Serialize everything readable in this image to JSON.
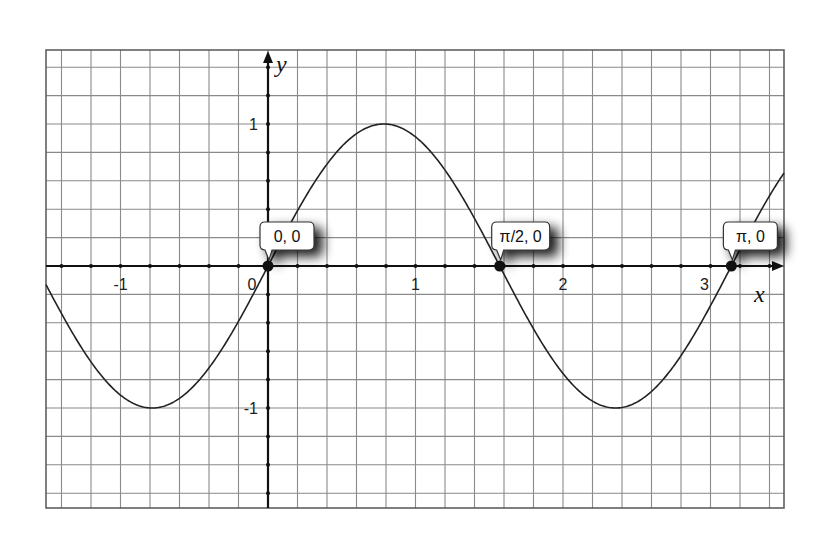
{
  "chart_data": {
    "type": "line",
    "title": "",
    "function": "y = sin(2x)",
    "xlabel": "x",
    "ylabel": "y",
    "xlim": [
      -1.5,
      3.5
    ],
    "ylim": [
      -1.7,
      1.5
    ],
    "grid": true,
    "grid_step_x": 0.2,
    "grid_step_y": 0.2,
    "x_ticks": [
      {
        "value": -1,
        "label": "-1"
      },
      {
        "value": 0,
        "label": "0"
      },
      {
        "value": 1,
        "label": "1"
      },
      {
        "value": 2,
        "label": "2"
      },
      {
        "value": 3,
        "label": "3"
      }
    ],
    "y_ticks": [
      {
        "value": 1,
        "label": "1"
      },
      {
        "value": -1,
        "label": "-1"
      }
    ],
    "series": [
      {
        "name": "sin(2x)",
        "color": "#222222",
        "x": [
          -1.5,
          -1.178,
          -0.785,
          -0.393,
          0,
          0.393,
          0.785,
          1.178,
          1.571,
          1.963,
          2.356,
          2.749,
          3.142,
          3.5
        ],
        "values": [
          -0.141,
          -0.707,
          -1,
          -0.707,
          0,
          0.707,
          1,
          0.707,
          0,
          -0.707,
          -1,
          -0.707,
          0,
          0.657
        ]
      }
    ],
    "annotations": [
      {
        "x": 0,
        "y": 0,
        "label": "0, 0"
      },
      {
        "x": 1.5708,
        "y": 0,
        "label": "π/2, 0"
      },
      {
        "x": 3.1416,
        "y": 0,
        "label": "π, 0"
      }
    ]
  },
  "colors": {
    "grid": "#8a8a8a",
    "axis": "#111111",
    "curve": "#222222",
    "frame": "#555555"
  }
}
